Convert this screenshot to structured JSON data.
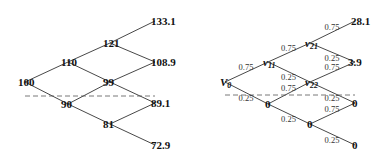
{
  "stock_tree": {
    "nodes": [
      {
        "id": "s0",
        "label": "100"
      },
      {
        "id": "s11",
        "label": "110"
      },
      {
        "id": "s12",
        "label": "90"
      },
      {
        "id": "s21",
        "label": "121"
      },
      {
        "id": "s22",
        "label": "99"
      },
      {
        "id": "s23",
        "label": "81"
      },
      {
        "id": "s31",
        "label": "133.1"
      },
      {
        "id": "s32",
        "label": "108.9"
      },
      {
        "id": "s33",
        "label": "89.1"
      },
      {
        "id": "s34",
        "label": "72.9"
      }
    ],
    "edges": [
      [
        "s0",
        "s11"
      ],
      [
        "s0",
        "s12"
      ],
      [
        "s11",
        "s21"
      ],
      [
        "s11",
        "s22"
      ],
      [
        "s12",
        "s22"
      ],
      [
        "s12",
        "s23"
      ],
      [
        "s21",
        "s31"
      ],
      [
        "s21",
        "s32"
      ],
      [
        "s22",
        "s32"
      ],
      [
        "s22",
        "s33"
      ],
      [
        "s23",
        "s33"
      ],
      [
        "s23",
        "s34"
      ]
    ],
    "strike_line": "dashed"
  },
  "option_tree": {
    "nodes": [
      {
        "id": "v0",
        "label": "V",
        "sub": "0"
      },
      {
        "id": "v11",
        "label": "v",
        "sub": "11"
      },
      {
        "id": "v12",
        "label": "0"
      },
      {
        "id": "v21",
        "label": "v",
        "sub": "21"
      },
      {
        "id": "v22",
        "label": "v",
        "sub": "22"
      },
      {
        "id": "v23",
        "label": "0"
      },
      {
        "id": "v31",
        "label": "28.1"
      },
      {
        "id": "v32",
        "label": "3.9"
      },
      {
        "id": "v33",
        "label": "0"
      },
      {
        "id": "v34",
        "label": "0"
      }
    ],
    "edges": [
      {
        "from": "v0",
        "to": "v11",
        "p": "0.75"
      },
      {
        "from": "v0",
        "to": "v12",
        "p": "0.25"
      },
      {
        "from": "v11",
        "to": "v21",
        "p": "0.75"
      },
      {
        "from": "v11",
        "to": "v22",
        "p": "0.25"
      },
      {
        "from": "v12",
        "to": "v22",
        "p": "0.75"
      },
      {
        "from": "v12",
        "to": "v23",
        "p": "0.25"
      },
      {
        "from": "v21",
        "to": "v31",
        "p": "0.75"
      },
      {
        "from": "v21",
        "to": "v32",
        "p": "0.25"
      },
      {
        "from": "v22",
        "to": "v32",
        "p": "0.75"
      },
      {
        "from": "v22",
        "to": "v33",
        "p": "0.25"
      },
      {
        "from": "v23",
        "to": "v33",
        "p": "0.75"
      },
      {
        "from": "v23",
        "to": "v34",
        "p": "0.25"
      }
    ],
    "strike_line": "dashed"
  }
}
